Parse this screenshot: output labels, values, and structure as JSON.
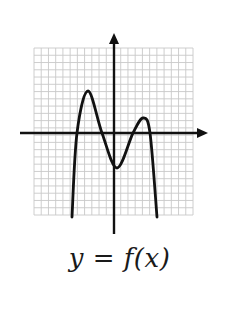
{
  "figure": {
    "caption": "y = f(x)",
    "grid": {
      "left": 34,
      "top": 48,
      "right": 193,
      "bottom": 215,
      "cols": 22,
      "rows": 23,
      "line_color": "#c8c8c8"
    },
    "axes": {
      "x_axis": {
        "y": 133,
        "x_start": 20,
        "x_end": 208
      },
      "y_axis": {
        "x": 114,
        "y_start": 234,
        "y_end": 33
      },
      "color": "#111111"
    },
    "curve": {
      "description": "Quartic-like polynomial with negative leading coefficient; three turning points (local max left, local min near y-axis, local max right); four x-intercepts; both ends go down",
      "color": "#111111",
      "key_points": [
        {
          "label": "left-end",
          "x": 72,
          "y": 217
        },
        {
          "label": "x-intercept-1",
          "x": 77,
          "y": 133
        },
        {
          "label": "local-max-left",
          "x": 88,
          "y": 91
        },
        {
          "label": "x-intercept-2",
          "x": 102,
          "y": 133
        },
        {
          "label": "local-min",
          "x": 117,
          "y": 168
        },
        {
          "label": "x-intercept-3",
          "x": 133,
          "y": 133
        },
        {
          "label": "local-max-right",
          "x": 143,
          "y": 118
        },
        {
          "label": "x-intercept-4",
          "x": 150,
          "y": 133
        },
        {
          "label": "right-end",
          "x": 157,
          "y": 217
        }
      ]
    }
  }
}
